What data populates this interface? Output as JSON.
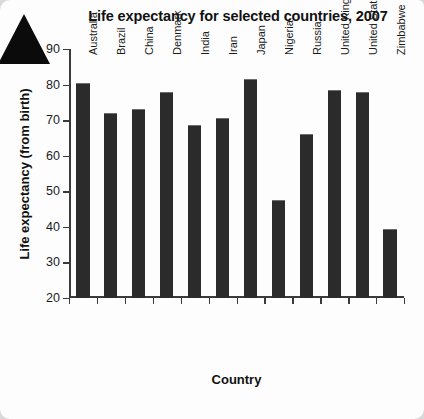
{
  "chart_data": {
    "type": "bar",
    "title": "Life expectancy for selected countries, 2007",
    "xlabel": "Country",
    "ylabel": "Life expectancy (from birth)",
    "categories": [
      "Australia",
      "Brazil",
      "China",
      "Denmark",
      "India",
      "Iran",
      "Japan",
      "Nigeria",
      "Russia",
      "United Kingdom",
      "United States",
      "Zimbabwe"
    ],
    "values": [
      80.5,
      72,
      73,
      78,
      68.5,
      70.5,
      81.5,
      47.5,
      66,
      78.5,
      78,
      39.5
    ],
    "ylim": [
      20,
      90
    ],
    "yticks": [
      20,
      30,
      40,
      50,
      60,
      70,
      80,
      90
    ],
    "grid": false,
    "legend": false,
    "bar_color": "#2b2b2b",
    "axis_color": "#3b3b3b"
  },
  "decoration": {
    "corner_marker": "black-triangle"
  }
}
